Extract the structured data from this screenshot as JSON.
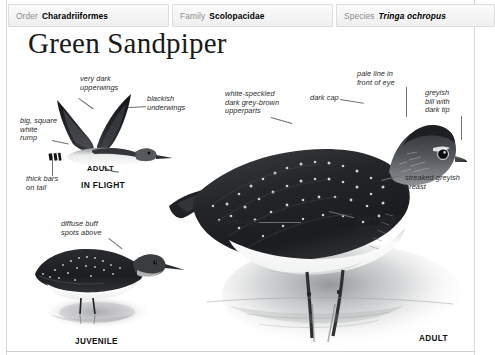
{
  "taxonomy": [
    {
      "key": "Order",
      "value": "Charadriiformes",
      "italic": false
    },
    {
      "key": "Family",
      "value": "Scolopacidae",
      "italic": false
    },
    {
      "key": "Species",
      "value": "Tringa ochropus",
      "italic": true
    }
  ],
  "title": "Green Sandpiper",
  "annotations": {
    "very_dark_upperwings": "very dark\nupperwings",
    "blackish_underwings": "blackish\nunderwings",
    "big_square_white_rump": "big, square\nwhite\nrump",
    "thick_bars_on_tail": "thick bars\non tail",
    "diffuse_buff_spots": "diffuse buff\nspots above",
    "white_speckled_upperparts": "white-speckled\ndark grey-brown\nupperparts",
    "dark_cap": "dark cap",
    "pale_line_front_of_eye": "pale line in\nfront of eye",
    "greyish_bill_dark_tip": "greyish\nbill with\ndark tip",
    "streaked_greyish_breast": "streaked greyish\nbreast",
    "bright_white_underside": "bright white\nunderside",
    "greenish_legs": "greenish legs"
  },
  "captions": {
    "flight_adult": "ADULT",
    "flight_state": "IN FLIGHT",
    "juvenile": "JUVENILE",
    "adult": "ADULT"
  },
  "colors": {
    "plumage_dark": "#1e1f21",
    "plumage_mid": "#4a4c4e",
    "plumage_light": "#b9bbbd",
    "underside": "#f7f7f7",
    "leader_line": "#6f6f6f",
    "text": "#2b2b2b",
    "header_key": "#8d8d8d",
    "border": "#dddddd"
  }
}
